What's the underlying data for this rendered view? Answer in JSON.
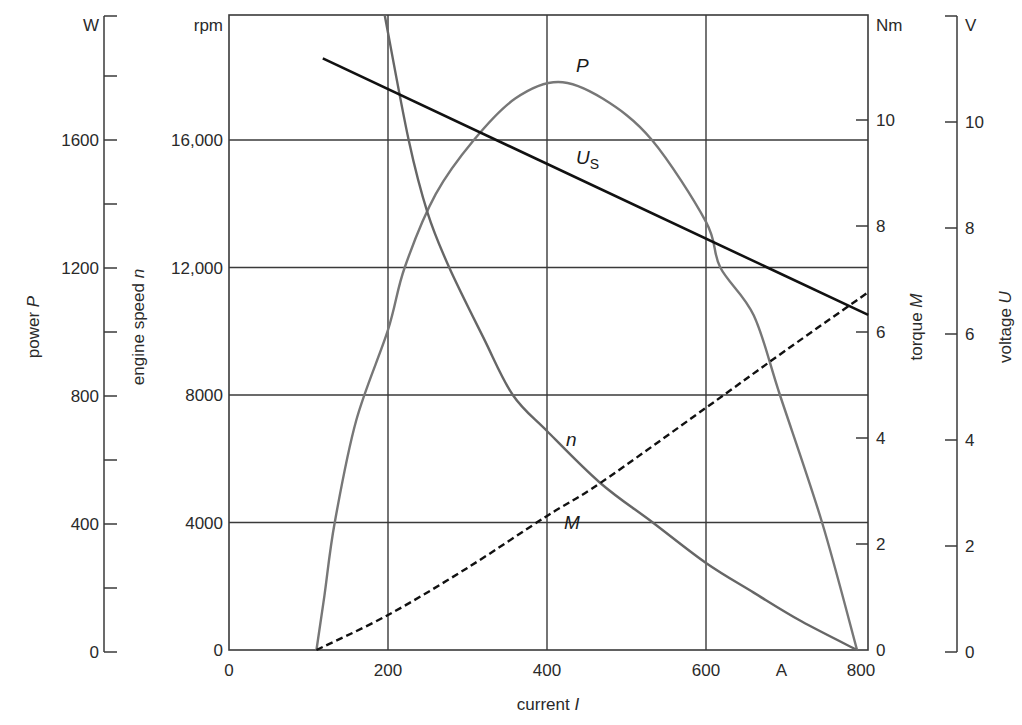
{
  "chart_data": {
    "type": "line",
    "title": "",
    "xlabel": "current I",
    "x_unit": "A",
    "xlim": [
      0,
      804
    ],
    "x_ticks": [
      0,
      200,
      400,
      600,
      800
    ],
    "x_tick_labels": [
      "0",
      "200",
      "400",
      "600",
      "800"
    ],
    "grid": {
      "x": [
        200,
        400,
        600
      ],
      "y_rpm": [
        4000,
        8000,
        12000,
        16000
      ]
    },
    "axes": {
      "power": {
        "label": "power P",
        "unit": "W",
        "range": [
          0,
          2000
        ],
        "major_ticks": [
          0,
          400,
          800,
          1200,
          1600
        ],
        "major_tick_labels": [
          "0",
          "400",
          "800",
          "1200",
          "1600"
        ],
        "minor_ticks": [
          200,
          600,
          1000,
          1400,
          1800
        ]
      },
      "speed": {
        "label": "engine speed n",
        "unit": "rpm",
        "range": [
          0,
          20000
        ],
        "major_ticks": [
          0,
          4000,
          8000,
          12000,
          16000
        ],
        "major_tick_labels": [
          "0",
          "4000",
          "8000",
          "12,000",
          "16,000"
        ]
      },
      "torque": {
        "label": "torque M",
        "unit": "Nm",
        "range": [
          0,
          12
        ],
        "major_ticks": [
          0,
          2,
          4,
          6,
          8,
          10
        ],
        "major_tick_labels": [
          "0",
          "2",
          "4",
          "6",
          "8",
          "10"
        ]
      },
      "voltage": {
        "label": "voltage U",
        "unit": "V",
        "range": [
          0,
          12
        ],
        "major_ticks": [
          0,
          2,
          4,
          6,
          8,
          10,
          12
        ],
        "major_tick_labels": [
          "0",
          "2",
          "4",
          "6",
          "8",
          "10",
          ""
        ]
      }
    },
    "series": [
      {
        "name": "P",
        "label": "P",
        "axis": "power",
        "style": "solid",
        "color": "#777777",
        "x": [
          110,
          120,
          133,
          160,
          200,
          221,
          260,
          308,
          360,
          414,
          470,
          532,
          600,
          618,
          660,
          693,
          746,
          790
        ],
        "values": [
          0,
          170,
          400,
          720,
          1004,
          1200,
          1430,
          1600,
          1730,
          1782,
          1730,
          1600,
          1343,
          1200,
          1050,
          800,
          400,
          0
        ],
        "label_pos": [
          576,
          72
        ]
      },
      {
        "name": "n",
        "label": "n",
        "axis": "speed",
        "style": "solid",
        "color": "#666666",
        "x": [
          196,
          226,
          250,
          277,
          320,
          357,
          400,
          467,
          533,
          600,
          660,
          720,
          790
        ],
        "values": [
          19900,
          16000,
          13700,
          12000,
          9800,
          8000,
          6870,
          5240,
          4000,
          2730,
          1800,
          900,
          0
        ],
        "label_pos": [
          566,
          446
        ]
      },
      {
        "name": "M",
        "label": "M",
        "axis": "torque",
        "style": "dashed",
        "color": "#111111",
        "x": [
          110,
          200,
          300,
          400,
          467,
          600,
          700,
          804
        ],
        "values": [
          0,
          0.66,
          1.55,
          2.53,
          3.15,
          4.57,
          5.65,
          6.75
        ],
        "label_pos": [
          564,
          529
        ]
      },
      {
        "name": "U_S",
        "label": "U",
        "label_sub": "S",
        "axis": "voltage",
        "style": "solid",
        "color": "#111111",
        "x": [
          118,
          804
        ],
        "values": [
          11.2,
          6.36
        ],
        "label_pos": [
          576,
          164
        ]
      }
    ]
  },
  "labels": {
    "power_unit": "W",
    "speed_unit": "rpm",
    "torque_unit": "Nm",
    "voltage_unit": "V",
    "current_unit": "A",
    "power_title": "power P",
    "speed_title": "engine speed n",
    "torque_title": "torque M",
    "voltage_title": "voltage U",
    "current_title": "current I"
  }
}
